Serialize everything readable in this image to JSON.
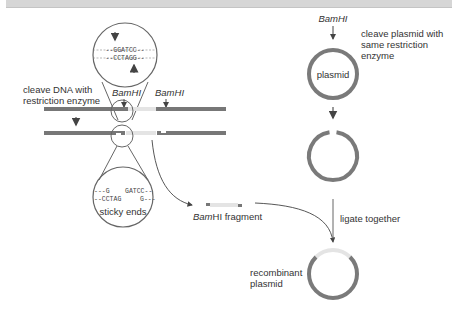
{
  "colors": {
    "dna": "#777777",
    "insert": "#e4e4e4",
    "plasmid": "#7a7a7a",
    "line": "#555555",
    "text": "#333333",
    "topbar": "#d6d6d6"
  },
  "left_panel": {
    "zoom_top": {
      "top_strand": "--GGATCC--",
      "bottom_strand": "--CCTAGG--"
    },
    "step_label_line1": "cleave DNA with",
    "step_label_line2": "restriction enzyme",
    "enzyme_site_1": "BamHI",
    "enzyme_site_2": "BamHI",
    "zoom_bottom": {
      "top_left": "---G",
      "top_right": "GATCC--",
      "bottom_left": "--CCTAG",
      "bottom_right": "G---",
      "caption": "sticky ends"
    },
    "fragment_label_italic": "Bam",
    "fragment_label_rest": "HI fragment"
  },
  "right_panel": {
    "enzyme_label": "BamHI",
    "step_label_line1": "cleave plasmid with",
    "step_label_line2": "same restriction",
    "step_label_line3": "enzyme",
    "plasmid_label": "plasmid",
    "ligate_label": "ligate together",
    "result_label_line1": "recombinant",
    "result_label_line2": "plasmid"
  }
}
